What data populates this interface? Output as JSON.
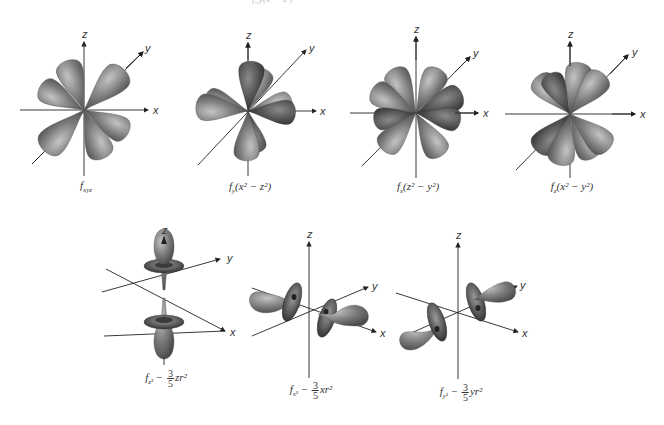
{
  "figure": {
    "top_cutoff_text": "f_y(x² − z²)",
    "axis_labels": {
      "x": "x",
      "y": "y",
      "z": "z"
    },
    "colors": {
      "lobe": "#7a7a7a",
      "lobe_light": "#b5b5b5",
      "lobe_dark": "#3e3e3e",
      "axis": "#222222"
    },
    "orbitals": [
      {
        "id": "fxyz",
        "label_main": "f",
        "label_sub": "xyz",
        "label_rest": ""
      },
      {
        "id": "fy_x2_z2",
        "label_main": "f",
        "label_sub": "y",
        "label_rest": "(x² − z²)"
      },
      {
        "id": "fx_z2_y2",
        "label_main": "f",
        "label_sub": "x",
        "label_rest": "(z² − y²)"
      },
      {
        "id": "fz_x2_y2",
        "label_main": "f",
        "label_sub": "z",
        "label_rest": "(x² − y²)"
      },
      {
        "id": "fz3",
        "label_main": "f",
        "label_sub": "z³",
        "label_minus": " − ",
        "frac_num": "3",
        "frac_den": "5",
        "label_tail": "zr²"
      },
      {
        "id": "fx3",
        "label_main": "f",
        "label_sub": "x³",
        "label_minus": " − ",
        "frac_num": "3",
        "frac_den": "5",
        "label_tail": "xr²"
      },
      {
        "id": "fy3",
        "label_main": "f",
        "label_sub": "y³",
        "label_minus": " − ",
        "frac_num": "3",
        "frac_den": "5",
        "label_tail": "yr²"
      }
    ]
  }
}
